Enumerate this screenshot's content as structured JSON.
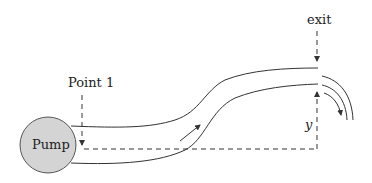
{
  "diagram": {
    "pump": {
      "label": "Pump",
      "fill": "#d4d4d4",
      "stroke": "#555555"
    },
    "point1": {
      "label": "Point 1"
    },
    "exit": {
      "label": "exit"
    },
    "height": {
      "label": "y"
    },
    "colors": {
      "line": "#333333",
      "background": "#ffffff"
    }
  }
}
